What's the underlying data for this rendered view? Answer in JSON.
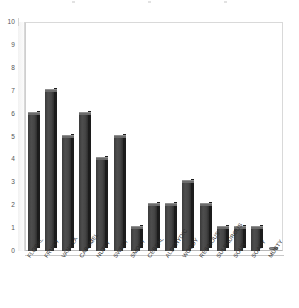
{
  "chart_data": {
    "type": "bar",
    "title": "",
    "subtitle": "",
    "xlabel": "",
    "ylabel": "",
    "ylim": [
      0,
      10
    ],
    "y_ticks": [
      0,
      1,
      2,
      3,
      4,
      5,
      6,
      7,
      8,
      9,
      10
    ],
    "grid": false,
    "legend": false,
    "legend_position": "none",
    "style": "3d-column",
    "bar_color": "#454545",
    "bar_side_color": "#1c1c1c",
    "bar_top_color": "#6b6b6b",
    "plot_border_color": "#cfcfcf",
    "categories": [
      "FLORAL",
      "FRUITY",
      "VANILLA",
      "CARAMEL",
      "NUTTY",
      "SWEET",
      "SMOKY",
      "CEREAL",
      "ALDEHYDIC",
      "WOODY",
      "RESINOUS",
      "SULPHUROUS",
      "SOUR",
      "SOAPY",
      "MUSTY"
    ],
    "values": [
      6,
      7,
      5,
      6,
      4,
      5,
      1,
      2,
      2,
      3,
      2,
      1,
      1,
      1,
      0
    ],
    "series": [
      {
        "name": "",
        "values": [
          6,
          7,
          5,
          6,
          4,
          5,
          1,
          2,
          2,
          3,
          2,
          1,
          1,
          1,
          0
        ]
      }
    ]
  }
}
